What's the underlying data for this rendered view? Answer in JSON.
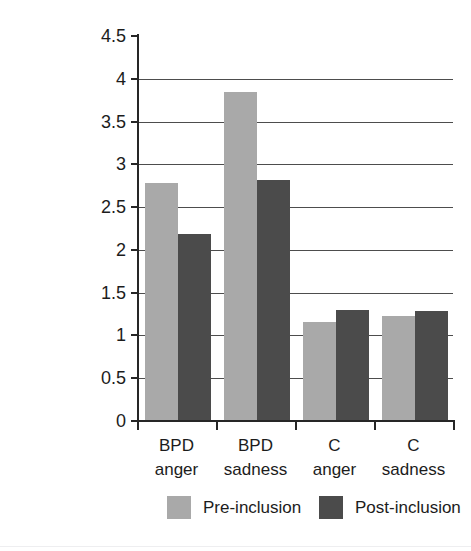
{
  "chart_data": {
    "type": "bar",
    "title": "",
    "xlabel": "",
    "ylabel": "",
    "ylim": [
      0,
      4.5
    ],
    "ytick_step": 0.5,
    "grid": true,
    "grid_axis": "y",
    "legend_position": "bottom",
    "categories": [
      "BPD anger",
      "BPD sadness",
      "C anger",
      "C sadness"
    ],
    "category_lines": [
      [
        "BPD",
        "anger"
      ],
      [
        "BPD",
        "sadness"
      ],
      [
        "C",
        "anger"
      ],
      [
        "C",
        "sadness"
      ]
    ],
    "ytick_labels": [
      "4.5",
      "4",
      "3.5",
      "3",
      "2.5",
      "2",
      "1.5",
      "1",
      "0.5",
      "0"
    ],
    "ytick_values": [
      4.5,
      4,
      3.5,
      3,
      2.5,
      2,
      1.5,
      1,
      0.5,
      0
    ],
    "series": [
      {
        "name": "Pre-inclusion",
        "color": "#a9a9a9",
        "values": [
          2.78,
          3.84,
          1.16,
          1.23
        ]
      },
      {
        "name": "Post-inclusion",
        "color": "#4b4b4b",
        "values": [
          2.19,
          2.82,
          1.3,
          1.29
        ]
      }
    ]
  },
  "legend": {
    "items": [
      {
        "label": "Pre-inclusion",
        "swatch": "pre"
      },
      {
        "label": "Post-inclusion",
        "swatch": "post"
      }
    ]
  },
  "colors": {
    "pre_inclusion": "#a9a9a9",
    "post_inclusion": "#4b4b4b",
    "axis": "#262626",
    "gridline": "#4d4d4d",
    "background": "#ffffff"
  }
}
